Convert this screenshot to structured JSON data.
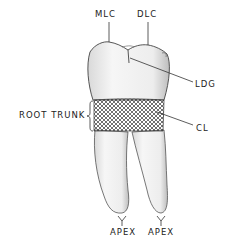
{
  "diagram": {
    "labels": {
      "mlc": "MLC",
      "dlc": "DLC",
      "ldg": "LDG",
      "root_trunk": "ROOT TRUNK",
      "cl": "CL",
      "apex_left": "APEX",
      "apex_right": "APEX"
    },
    "colors": {
      "line": "#333333",
      "fill": "#f4f4f4",
      "shade": "#c8c8c8",
      "background": "#ffffff"
    }
  }
}
